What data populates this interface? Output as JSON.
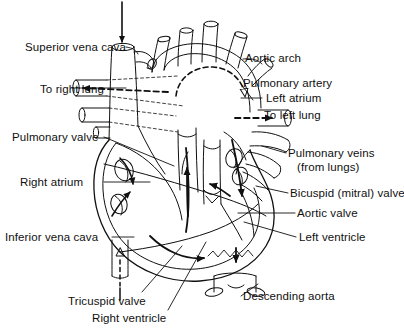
{
  "figure": {
    "type": "anatomical-diagram",
    "background_color": "#ffffff",
    "line_color": "#101010",
    "width": 404,
    "height": 328
  },
  "labels": {
    "superior_vena_cava": "Superior vena cava",
    "to_right_lung": "To right lung",
    "pulmonary_valve": "Pulmonary valve",
    "right_atrium": "Right atrium",
    "inferior_vena_cava": "Inferior vena cava",
    "tricuspid_valve": "Tricuspid valve",
    "right_ventricle": "Right ventricle",
    "aortic_arch": "Aortic arch",
    "pulmonary_artery": "Pulmonary artery",
    "left_atrium": "Left atrium",
    "to_left_lung": "To left lung",
    "pulmonary_veins": "Pulmonary veins",
    "from_lungs": "(from lungs)",
    "bicuspid_mitral_valve": "Bicuspid (mitral) valve",
    "aortic_valve": "Aortic valve",
    "left_ventricle": "Left ventricle",
    "descending_aorta": "Descending aorta"
  },
  "label_list": [
    {
      "id": "superior-vena-cava",
      "text": "Superior vena cava",
      "side": "left"
    },
    {
      "id": "to-right-lung",
      "text": "To right lung",
      "side": "left"
    },
    {
      "id": "pulmonary-valve",
      "text": "Pulmonary valve",
      "side": "left"
    },
    {
      "id": "right-atrium",
      "text": "Right atrium",
      "side": "left"
    },
    {
      "id": "inferior-vena-cava",
      "text": "Inferior vena cava",
      "side": "left"
    },
    {
      "id": "tricuspid-valve",
      "text": "Tricuspid valve",
      "side": "bottom"
    },
    {
      "id": "right-ventricle",
      "text": "Right ventricle",
      "side": "bottom"
    },
    {
      "id": "aortic-arch",
      "text": "Aortic arch",
      "side": "right"
    },
    {
      "id": "pulmonary-artery",
      "text": "Pulmonary artery",
      "side": "right"
    },
    {
      "id": "left-atrium",
      "text": "Left atrium",
      "side": "right"
    },
    {
      "id": "to-left-lung",
      "text": "To left lung",
      "side": "right"
    },
    {
      "id": "pulmonary-veins",
      "text": "Pulmonary veins",
      "side": "right"
    },
    {
      "id": "from-lungs",
      "text": "(from lungs)",
      "side": "right"
    },
    {
      "id": "bicuspid-mitral-valve",
      "text": "Bicuspid (mitral) valve",
      "side": "right"
    },
    {
      "id": "aortic-valve",
      "text": "Aortic valve",
      "side": "right"
    },
    {
      "id": "left-ventricle",
      "text": "Left ventricle",
      "side": "right"
    },
    {
      "id": "descending-aorta",
      "text": "Descending aorta",
      "side": "right"
    }
  ]
}
